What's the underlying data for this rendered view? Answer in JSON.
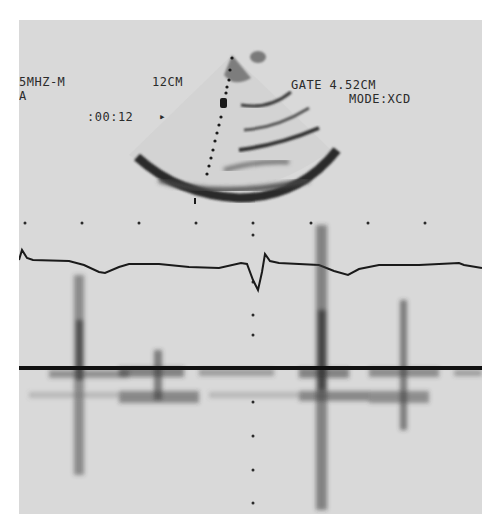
{
  "display": {
    "probe_label": "5MHZ-M",
    "probe_sub": "A",
    "depth": "12CM",
    "gate": "GATE 4.52CM",
    "mode": "MODE:XCD",
    "time": ":00:12",
    "time_marker": "▸"
  },
  "colors": {
    "background": "#d9d9d9",
    "trace": "#1a1a1a",
    "paper": "#ffffff"
  },
  "regions": {
    "sector_image": "2D sector echocardiogram with sampling cursor",
    "ecg_trace": "ECG trace with single QRS complex",
    "doppler_spectrum": "Doppler spectral display with baseline"
  }
}
